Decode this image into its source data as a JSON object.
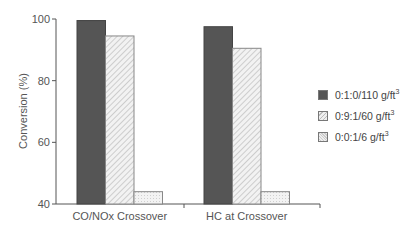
{
  "chart_data": {
    "type": "bar",
    "title": "",
    "xlabel": "",
    "ylabel": "Conversion (%)",
    "ylim": [
      40,
      100
    ],
    "yticks": [
      40,
      60,
      80,
      100
    ],
    "categories": [
      "CO/NOx Crossover",
      "HC at Crossover"
    ],
    "series": [
      {
        "name": "0:1:0/110 g/ft3",
        "label_base": "0:1:0/110 g/ft",
        "sup": "3",
        "values": [
          99.5,
          97.5
        ],
        "fill": "dark"
      },
      {
        "name": "0:9:1/60 g/ft3",
        "label_base": "0:9:1/60 g/ft",
        "sup": "3",
        "values": [
          94.5,
          90.5
        ],
        "fill": "hatched"
      },
      {
        "name": "0:0:1/6 g/ft3",
        "label_base": "0:0:1/6 g/ft",
        "sup": "3",
        "values": [
          44,
          44
        ],
        "fill": "light"
      }
    ],
    "grid": false,
    "legend_position": "right"
  },
  "colors": {
    "dark": "#555555",
    "axis": "#555555",
    "text": "#555555"
  }
}
